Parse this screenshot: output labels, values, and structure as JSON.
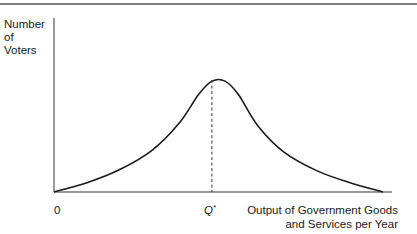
{
  "figure": {
    "y_axis_label_lines": [
      "Number",
      "of",
      "Voters"
    ],
    "x_axis_label_lines": [
      "Output of Government Goods",
      "and Services per Year"
    ],
    "origin_label": "0",
    "peak_label": "Q",
    "peak_label_superscript": "*"
  },
  "chart_data": {
    "type": "line",
    "title": "",
    "xlabel": "Output of Government Goods and Services per Year",
    "ylabel": "Number of Voters",
    "x_ticks": [
      "0",
      "Q*"
    ],
    "xlim": [
      0,
      1
    ],
    "ylim": [
      0,
      1
    ],
    "series": [
      {
        "name": "voter-distribution",
        "x": [
          0,
          0.1,
          0.2,
          0.3,
          0.38,
          0.44,
          0.48,
          0.52,
          0.56,
          0.62,
          0.7,
          0.8,
          0.9,
          1.0
        ],
        "y": [
          0,
          0.07,
          0.17,
          0.32,
          0.52,
          0.74,
          0.84,
          0.84,
          0.74,
          0.5,
          0.3,
          0.16,
          0.07,
          0
        ]
      }
    ],
    "peak_x": 0.48,
    "grid": false,
    "legend": "none"
  }
}
